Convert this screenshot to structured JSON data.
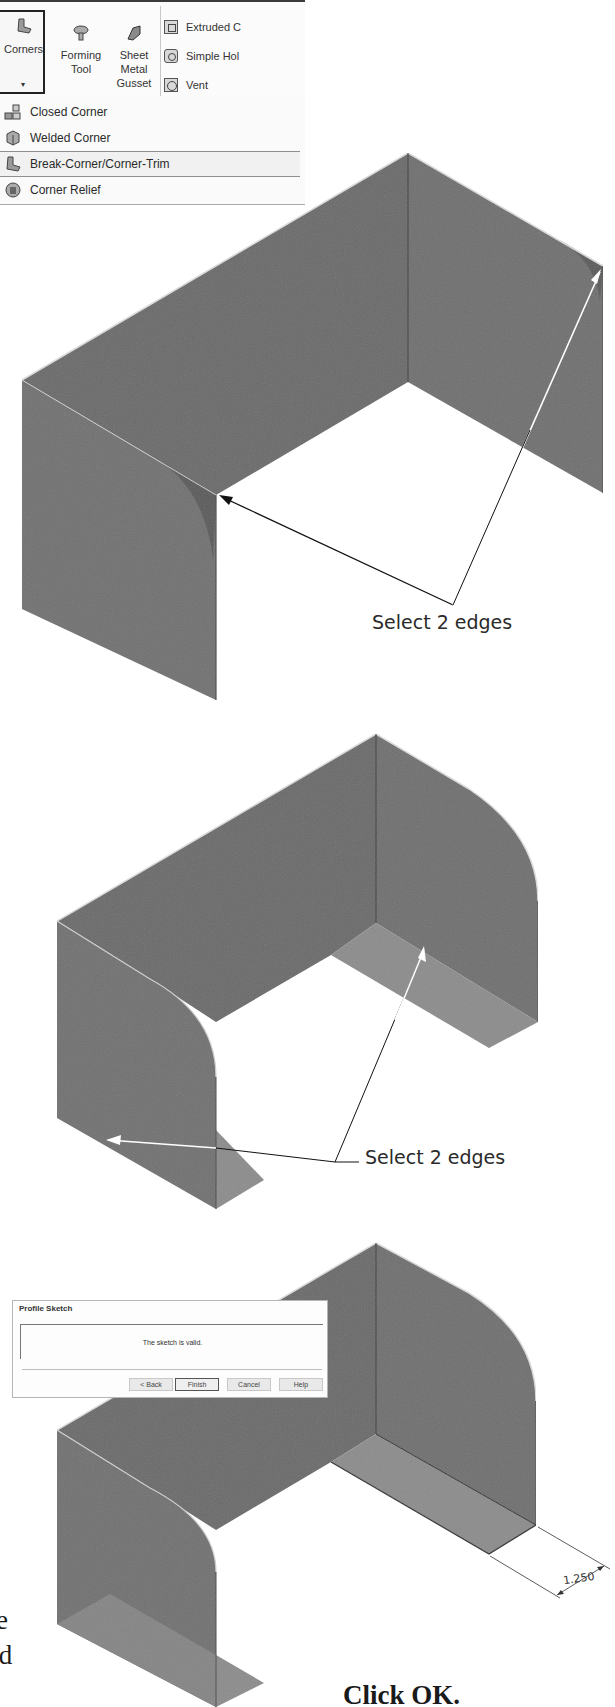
{
  "ribbon": {
    "corners_label": "Corners",
    "corners_dropdown_glyph": "▾",
    "tools": [
      {
        "label_lines": [
          "Forming",
          "Tool"
        ],
        "icon": "forming-tool-icon"
      },
      {
        "label_lines": [
          "Sheet",
          "Metal",
          "Gusset"
        ],
        "icon": "sheet-metal-gusset-icon"
      }
    ],
    "small_items": [
      {
        "label": "Extruded C",
        "icon": "extruded-cut-icon"
      },
      {
        "label": "Simple Hol",
        "icon": "simple-hole-icon"
      },
      {
        "label": "Vent",
        "icon": "vent-icon"
      }
    ]
  },
  "menu": {
    "items": [
      {
        "label": "Closed Corner",
        "icon": "closed-corner-icon"
      },
      {
        "label": "Welded Corner",
        "icon": "welded-corner-icon"
      },
      {
        "label": "Break-Corner/Corner-Trim",
        "icon": "break-corner-icon",
        "highlighted": true
      },
      {
        "label": "Corner Relief",
        "icon": "corner-relief-icon"
      }
    ]
  },
  "callouts": {
    "step1": "Select 2 edges",
    "step2": "Select 2 edges",
    "dimension": "1.250",
    "click_ok": "Click OK.",
    "side_fragment_1": "e",
    "side_fragment_2": ".d"
  },
  "dialog": {
    "title": "Profile Sketch",
    "message": "The sketch is valid.",
    "buttons": {
      "back": "< Back",
      "finish": "Finish",
      "cancel": "Cancel",
      "help": "Help"
    }
  },
  "colors": {
    "panel": "#6e6e6e",
    "panel_dark": "#5f5f5f",
    "floor": "#8a8a8a",
    "edge_highlight": "#d8d8d8",
    "text": "#2a2a2a"
  }
}
